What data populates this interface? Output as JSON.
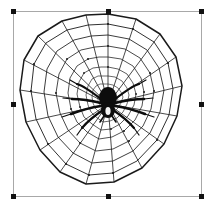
{
  "app": {
    "view": "image-selection-canvas",
    "background_color": "#ffffff"
  },
  "selection": {
    "border_color": "#a8a8a8",
    "handle_color": "#111111",
    "handle_count": 8,
    "bounds": {
      "x": 13,
      "y": 11,
      "width": 189,
      "height": 186
    },
    "handles": [
      {
        "name": "handle-top-left",
        "position": "nw"
      },
      {
        "name": "handle-top-center",
        "position": "n"
      },
      {
        "name": "handle-top-right",
        "position": "ne"
      },
      {
        "name": "handle-middle-left",
        "position": "w"
      },
      {
        "name": "handle-middle-right",
        "position": "e"
      },
      {
        "name": "handle-bottom-left",
        "position": "sw"
      },
      {
        "name": "handle-bottom-center",
        "position": "s"
      },
      {
        "name": "handle-bottom-right",
        "position": "se"
      }
    ]
  },
  "artwork": {
    "title": "Spider Web With Spider",
    "type": "line-art-clipart",
    "line_color": "#1a1a1a",
    "spider_color": "#0d0d0d",
    "fill_color": "#ffffff",
    "web": {
      "shape": "polygonal-orb-web",
      "radial_spokes": 16,
      "concentric_rings": 9,
      "center": {
        "x": 94,
        "y": 92
      },
      "outer_radius_x": 92,
      "outer_radius_y": 90,
      "inner_radius_ratio": 0.12
    },
    "spider": {
      "legs": 8,
      "body_parts": [
        "abdomen",
        "cephalothorax"
      ],
      "center": {
        "x": 94,
        "y": 92
      }
    }
  }
}
